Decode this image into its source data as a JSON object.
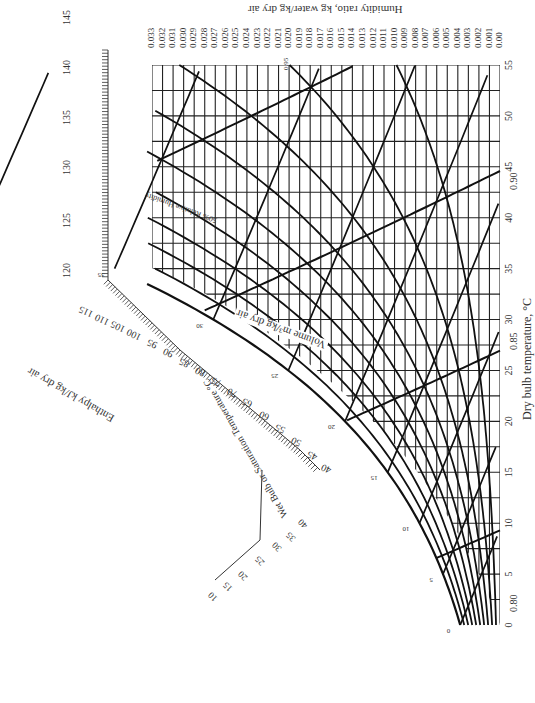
{
  "chart_data": {
    "type": "line",
    "orientation": "rotated; dry bulb axis runs vertically on right edge, humidity ratio axis runs horizontally along top (both printed upside-down/rotated)",
    "xlabel": "Dry bulb temperature, °C",
    "ylabel": "Humidity ratio, kg water/kg dry air",
    "dry_bulb_ticks": [
      0,
      5,
      10,
      15,
      20,
      25,
      30,
      35,
      40,
      45,
      50,
      55
    ],
    "dry_bulb_range": [
      0,
      55
    ],
    "humidity_ratio_ticks": [
      "0.00",
      "0.001",
      "0.002",
      "0.003",
      "0.004",
      "0.005",
      "0.006",
      "0.007",
      "0.008",
      "0.009",
      "0.010",
      "0.011",
      "0.012",
      "0.013",
      "0.014",
      "0.015",
      "0.016",
      "0.017",
      "0.018",
      "0.019",
      "0.020",
      "0.021",
      "0.022",
      "0.023",
      "0.024",
      "0.025",
      "0.026",
      "0.027",
      "0.028",
      "0.029",
      "0.030",
      "0.031",
      "0.032",
      "0.033"
    ],
    "humidity_ratio_range": [
      0,
      0.033
    ],
    "relative_humidity_curves": {
      "label": "Relative Humidity",
      "values_percent": [
        10,
        20,
        30,
        40,
        50,
        60,
        70,
        80,
        90,
        100
      ]
    },
    "specific_volume_lines": {
      "label": "Volume m³/kg dry air",
      "values": [
        "0.80",
        "0.85",
        "0.90",
        "0.95"
      ]
    },
    "enthalpy_scale": {
      "label": "Enthalpy kJ/kg dry air",
      "ticks": [
        40,
        45,
        50,
        55,
        60,
        65,
        70,
        75,
        80,
        85,
        90,
        95,
        100,
        105,
        110,
        115,
        120,
        125,
        130,
        135,
        140,
        145
      ]
    },
    "wet_bulb_scale": {
      "label": "Wet Bulb or Saturation Temperature °C",
      "ticks_on_curve": [
        0,
        5,
        10,
        15,
        20,
        25,
        30,
        35,
        40,
        45,
        50,
        55
      ],
      "enthalpy_inner_ticks": [
        10,
        15,
        20,
        25,
        30,
        35,
        40
      ]
    },
    "grid": true
  },
  "labels": {
    "humidity_axis_title": "Humidity ratio, kg water/kg dry air",
    "dry_bulb_axis_title": "Dry bulb temperature, °C",
    "enthalpy_title": "Enthalpy kJ/kg dry air",
    "wet_bulb_title": "Wet Bulb or Saturation Temperature °C",
    "volume_title": "Volume m³/kg dry air",
    "rh_title": "50% Relative Humidity",
    "vol_080": "0.80",
    "vol_085": "0.85",
    "vol_090": "0.90",
    "vol_095": "0.95"
  }
}
